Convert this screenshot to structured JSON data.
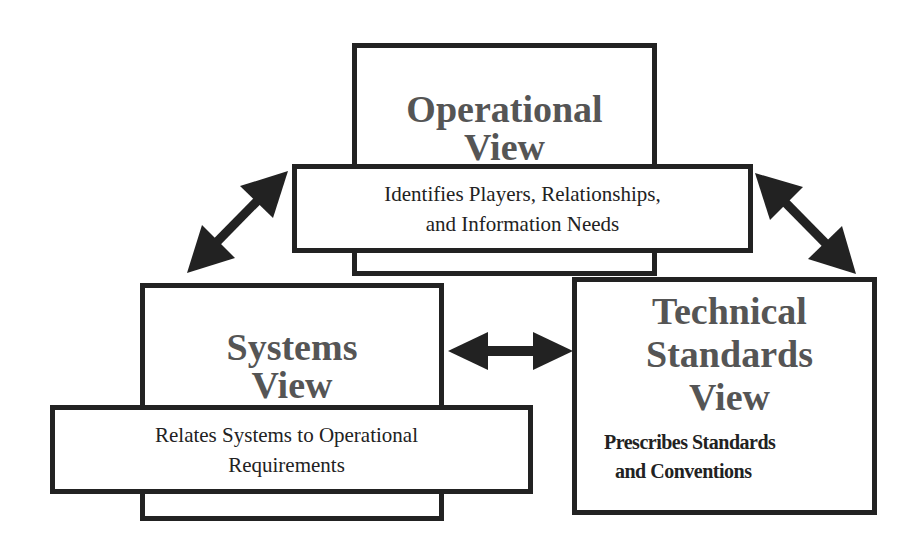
{
  "diagram": {
    "operational": {
      "title_line1": "Operational",
      "title_line2": "View",
      "desc_line1": "Identifies Players, Relationships,",
      "desc_line2": "and Information Needs"
    },
    "systems": {
      "title_line1": "Systems",
      "title_line2": "View",
      "desc_line1": "Relates Systems to Operational",
      "desc_line2": "Requirements"
    },
    "technical": {
      "title_line1": "Technical",
      "title_line2": "Standards",
      "title_line3": "View",
      "desc_line1": "Prescribes Standards",
      "desc_line2": "and Conventions"
    },
    "colors": {
      "border": "#222222",
      "title": "#555555",
      "text": "#222222"
    }
  }
}
